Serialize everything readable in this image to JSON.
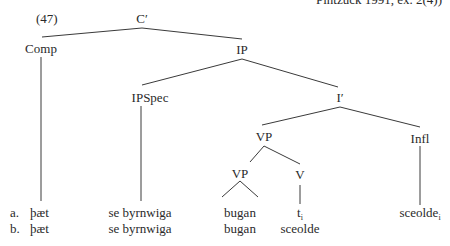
{
  "citation": "Pintzuck 1991, ex. 2(4))",
  "example_number": "(47)",
  "tree": {
    "root": "C′",
    "comp": "Comp",
    "ip": "IP",
    "ipspec": "IPSpec",
    "ibar": "I′",
    "vp": "VP",
    "infl": "Infl",
    "vp_inner": "VP",
    "v": "V"
  },
  "rows": [
    {
      "marker": "a.",
      "comp": "þæt",
      "ipspec": "se byrnwiga",
      "vp_inner": "bugan",
      "v": "t",
      "v_sub": "i",
      "infl": "sceolde",
      "infl_sub": "i"
    },
    {
      "marker": "b.",
      "comp": "þæt",
      "ipspec": "se byrnwiga",
      "vp_inner": "bugan",
      "v": "sceolde",
      "v_sub": "",
      "infl": "",
      "infl_sub": ""
    }
  ],
  "colors": {
    "line": "#3a3a3a",
    "text": "#2a2a2a",
    "background": "#ffffff"
  }
}
